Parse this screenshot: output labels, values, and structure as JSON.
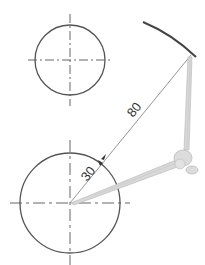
{
  "diagram": {
    "type": "geometric-construction",
    "colors": {
      "background": "#ffffff",
      "stroke": "#555555",
      "thin_line": "#666666",
      "arc": "#444444",
      "compass": "#d0d0d0",
      "compass_outline": "#b5b5b5"
    },
    "circles": [
      {
        "id": "top-circle",
        "cx": 70,
        "cy": 60,
        "r": 35,
        "centerline": true
      },
      {
        "id": "bottom-circle",
        "cx": 70,
        "cy": 203,
        "r": 50,
        "centerline": true
      }
    ],
    "arc": {
      "id": "radius-80-arc",
      "from": [
        143,
        22
      ],
      "to": [
        196,
        57
      ]
    },
    "dimensions": [
      {
        "label": "80",
        "from": [
          70,
          203
        ],
        "to": [
          190,
          55
        ]
      },
      {
        "label": "30",
        "from": [
          70,
          203
        ],
        "to": [
          103,
          162
        ]
      }
    ],
    "tool": {
      "name": "compass-icon",
      "pivot": [
        185,
        158
      ]
    }
  }
}
